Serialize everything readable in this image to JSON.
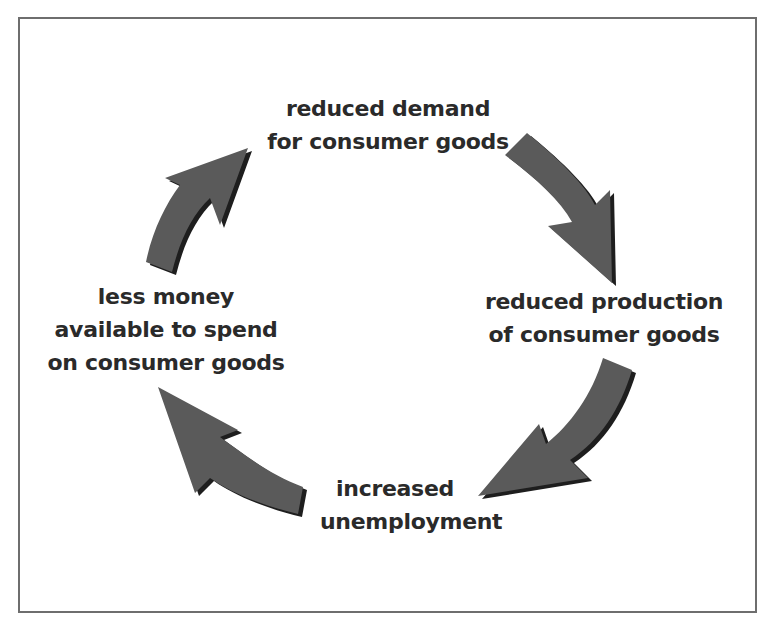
{
  "diagram": {
    "type": "cycle",
    "direction": "clockwise",
    "colors": {
      "arrow_fill": "#5a5a5a",
      "arrow_shadow": "#1e1e1e",
      "text": "#2a2a2a",
      "frame_border": "#6e6e6e",
      "background": "#ffffff"
    },
    "nodes": [
      {
        "id": "top",
        "lines": [
          "reduced demand",
          "for consumer goods"
        ]
      },
      {
        "id": "right",
        "lines": [
          "reduced production",
          "of consumer goods"
        ]
      },
      {
        "id": "bottom",
        "lines": [
          "increased",
          "unemployment"
        ]
      },
      {
        "id": "left",
        "lines": [
          "less money",
          "available to spend",
          "on consumer goods"
        ]
      }
    ],
    "arrows": [
      {
        "from": "top",
        "to": "right",
        "icon": "curved-arrow-down-right"
      },
      {
        "from": "right",
        "to": "bottom",
        "icon": "curved-arrow-down-left"
      },
      {
        "from": "bottom",
        "to": "left",
        "icon": "curved-arrow-up-left"
      },
      {
        "from": "left",
        "to": "top",
        "icon": "curved-arrow-up-right"
      }
    ]
  }
}
